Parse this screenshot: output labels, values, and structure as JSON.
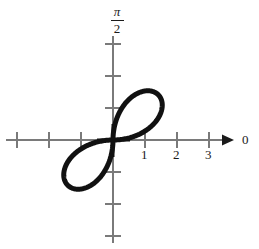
{
  "figure": {
    "kind": "polar-plot",
    "width": 259,
    "height": 249,
    "background": "#ffffff",
    "curve_color": "#111111",
    "axis_color": "#7a7a7a",
    "origin_cross_color": "#111111",
    "text_color": "#1a1a1a"
  },
  "axes": {
    "polar_axis_label": "0",
    "angle_axis_numerator": "π",
    "angle_axis_denominator": "2",
    "x_tick_labels": [
      "1",
      "2",
      "3"
    ],
    "x_tick_values": [
      1,
      2,
      3
    ],
    "left_tick_values": [
      -1,
      -2,
      -3
    ],
    "y_tick_values": [
      1,
      2,
      3,
      -1,
      -2,
      -3
    ],
    "unit_pixels": 32,
    "origin_px": {
      "x": 113,
      "y": 140
    },
    "has_right_arrow": true,
    "has_top_arrow": false
  },
  "chart_data": {
    "type": "line",
    "title": "",
    "subtitle": "",
    "xlabel": "0",
    "ylabel": "π/2",
    "coordinate_system": "polar",
    "equation": "r = 2 sin(2θ)",
    "petals": 2,
    "max_radius": 2,
    "petal_axis_angles_deg": [
      45,
      225
    ],
    "grid": false,
    "legend": null,
    "xlim": [
      -3.6,
      4.4
    ],
    "ylim": [
      -3.4,
      4.2
    ],
    "xticks": [
      -3,
      -2,
      -1,
      1,
      2,
      3
    ],
    "yticks": [
      -3,
      -2,
      -1,
      1,
      2,
      3
    ],
    "xtick_labels": [
      "",
      "",
      "",
      "1",
      "2",
      "3"
    ],
    "ytick_labels": [
      "",
      "",
      "",
      "",
      "",
      ""
    ],
    "annotations": [
      {
        "text": "π/2",
        "position": "top-of-vertical-axis"
      },
      {
        "text": "0",
        "position": "right-of-horizontal-axis-arrow"
      }
    ],
    "theta_deg": [
      0,
      5,
      10,
      15,
      20,
      25,
      30,
      35,
      40,
      45,
      50,
      55,
      60,
      65,
      70,
      75,
      80,
      85,
      90,
      185,
      190,
      195,
      200,
      205,
      210,
      215,
      220,
      225,
      230,
      235,
      240,
      245,
      250,
      255,
      260,
      265,
      270
    ],
    "r_values": [
      0.0,
      0.35,
      0.68,
      1.0,
      1.29,
      1.53,
      1.73,
      1.88,
      1.97,
      2.0,
      1.97,
      1.88,
      1.73,
      1.53,
      1.29,
      1.0,
      0.68,
      0.35,
      0.0,
      0.35,
      0.68,
      1.0,
      1.29,
      1.53,
      1.73,
      1.88,
      1.97,
      2.0,
      1.97,
      1.88,
      1.73,
      1.53,
      1.29,
      1.0,
      0.68,
      0.35,
      0.0
    ]
  }
}
